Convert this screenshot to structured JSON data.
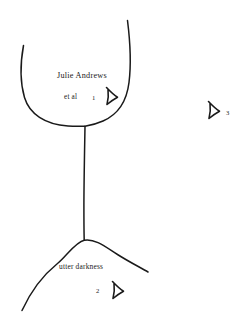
{
  "figure": {
    "kind": "hand-drawn-sketch",
    "background_color": "#ffffff",
    "ink_color": "#1a1a1a",
    "labels": {
      "title": "Julie Andrews",
      "subtitle": "et al",
      "bottom": "utter darkness"
    },
    "markers": [
      {
        "id": "1",
        "number": "1",
        "icon": "triangle-cursor-icon",
        "points": "right"
      },
      {
        "id": "2",
        "number": "2",
        "icon": "triangle-cursor-icon",
        "points": "right"
      },
      {
        "id": "3",
        "number": "3",
        "icon": "triangle-cursor-icon",
        "points": "right"
      }
    ]
  }
}
